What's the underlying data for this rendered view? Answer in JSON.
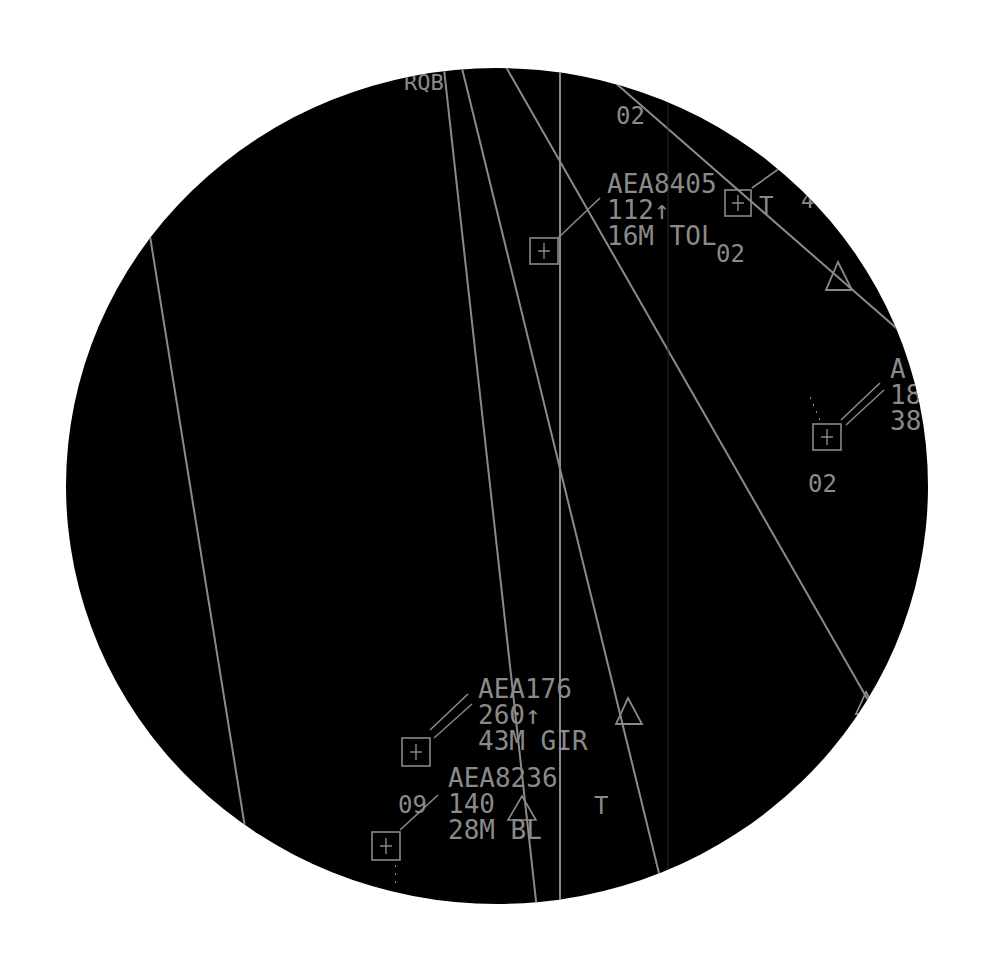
{
  "display": {
    "type": "radar-scope",
    "background": "#000000",
    "page_background": "#ffffff",
    "trace_color": "#8a8a8a",
    "scope": {
      "cx": 497,
      "cy": 486,
      "rx": 431,
      "ry": 418
    }
  },
  "top_labels": {
    "fix_label": "RQB",
    "altitude_label": "02"
  },
  "tracks": [
    {
      "callsign": "AEA8405",
      "level": "112",
      "trend": "↑",
      "line3": "16M TOL",
      "extra": "02",
      "symbol": "+"
    },
    {
      "callsign": "A",
      "level": "18",
      "trend": "",
      "line3": "38",
      "extra": "02",
      "symbol": "+"
    },
    {
      "callsign": "AEA176",
      "level": "260",
      "trend": "↑",
      "line3": "43M GIR",
      "extra": "",
      "symbol": "+"
    },
    {
      "callsign": "AEA8236",
      "level": "140",
      "trend": "△",
      "line3": "28M BL",
      "extra": "09",
      "symbol": "+"
    }
  ],
  "secondary_markers": {
    "t_marker_1": "T",
    "t_marker_2": "T",
    "edge_label": "4"
  }
}
